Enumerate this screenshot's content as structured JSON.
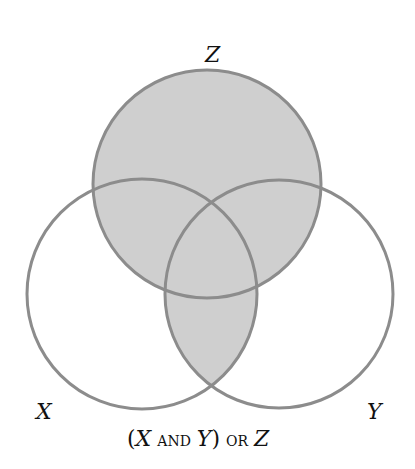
{
  "diagram": {
    "type": "venn",
    "sets": [
      {
        "id": "X",
        "label": "X",
        "cx": 142,
        "cy": 294,
        "r": 115
      },
      {
        "id": "Y",
        "label": "Y",
        "cx": 279,
        "cy": 294,
        "r": 114
      },
      {
        "id": "Z",
        "label": "Z",
        "cx": 207,
        "cy": 184,
        "r": 114
      }
    ],
    "shaded_region": "(X AND Y) OR Z",
    "caption": {
      "open_paren": "(",
      "x": "X",
      "and": "AND",
      "y": "Y",
      "close_paren": ")",
      "or": "OR",
      "z": "Z"
    },
    "colors": {
      "fill": "#cfcfcf",
      "stroke": "#8c8c8c",
      "text": "#111111"
    }
  }
}
